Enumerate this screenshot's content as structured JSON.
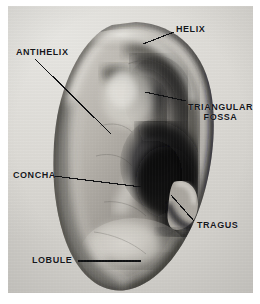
{
  "figure": {
    "kind": "anatomical-photograph",
    "view": "right ear, lateral view",
    "media": "black-and-white halftone photograph",
    "background_color": "#ffffff",
    "plate_color": "#dedcd7",
    "label_color": "#15161a",
    "leader_color": "#101113"
  },
  "labels": [
    {
      "id": "helix",
      "text": "HELIX",
      "lines": [
        "HELIX"
      ],
      "text_x": 176,
      "text_y": 25,
      "leader": {
        "x1": 174,
        "y1": 32,
        "x2": 143,
        "y2": 44
      }
    },
    {
      "id": "antihelix",
      "text": "ANTIHELIX",
      "lines": [
        "ANTIHELIX"
      ],
      "text_x": 16,
      "text_y": 48,
      "leader": {
        "x1": 35,
        "y1": 59,
        "x2": 111,
        "y2": 134
      }
    },
    {
      "id": "triangular-fossa",
      "text": "TRIANGULAR FOSSA",
      "lines": [
        "TRIANGULAR",
        "FOSSA"
      ],
      "text_x": 188,
      "text_y": 103,
      "leader": {
        "x1": 186,
        "y1": 101,
        "x2": 145,
        "y2": 92
      }
    },
    {
      "id": "concha",
      "text": "CONCHA",
      "lines": [
        "CONCHA"
      ],
      "text_x": 13,
      "text_y": 171,
      "leader": {
        "x1": 54,
        "y1": 176,
        "x2": 141,
        "y2": 187
      }
    },
    {
      "id": "tragus",
      "text": "TRAGUS",
      "lines": [
        "TRAGUS"
      ],
      "text_x": 197,
      "text_y": 221,
      "leader": {
        "x1": 194,
        "y1": 221,
        "x2": 171,
        "y2": 195
      }
    },
    {
      "id": "lobule",
      "text": "LOBULE",
      "lines": [
        "LOBULE"
      ],
      "text_x": 32,
      "text_y": 256,
      "leader": {
        "x1": 78,
        "y1": 261,
        "x2": 141,
        "y2": 261
      }
    }
  ]
}
